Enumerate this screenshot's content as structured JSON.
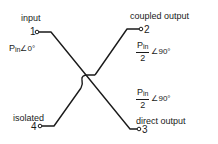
{
  "diagram": {
    "type": "directional-coupler-schematic",
    "ports": [
      {
        "number": "1",
        "label": "input",
        "signal": {
          "magnitude": "P",
          "subscript": "in",
          "angle": "∠0°"
        }
      },
      {
        "number": "2",
        "label": "coupled output",
        "signal": {
          "numerator": "P",
          "subscript": "in",
          "denominator": "2",
          "angle": "∠90°"
        }
      },
      {
        "number": "3",
        "label": "direct output",
        "signal": {
          "numerator": "P",
          "subscript": "in",
          "denominator": "2",
          "angle": "∠90°"
        }
      },
      {
        "number": "4",
        "label": "isolated"
      }
    ],
    "line_color": "#1a1a1a",
    "background": "#ffffff"
  }
}
